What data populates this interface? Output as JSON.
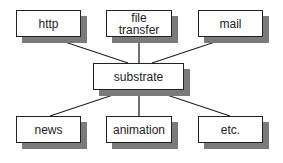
{
  "diagram": {
    "center": {
      "label": "substrate"
    },
    "top": [
      {
        "label": "http"
      },
      {
        "label": "file\ntransfer"
      },
      {
        "label": "mail"
      }
    ],
    "bottom": [
      {
        "label": "news"
      },
      {
        "label": "animation"
      },
      {
        "label": "etc."
      }
    ],
    "colors": {
      "border": "#222222",
      "shadow": "#7a7a7a",
      "line": "#222222"
    }
  }
}
